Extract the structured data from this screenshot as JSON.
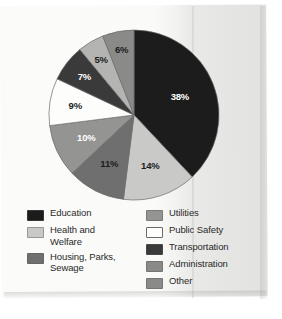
{
  "chart_data": {
    "type": "pie",
    "title": "",
    "subtitle": "",
    "xlabel": "",
    "ylabel": "",
    "grid": false,
    "legend_position": "bottom",
    "start_angle_deg": 0,
    "direction": "clockwise",
    "units": "percent",
    "total": 100,
    "categories": [
      "Education",
      "Health and Welfare",
      "Housing, Parks, Sewage",
      "Utilities",
      "Public Safety",
      "Transportation",
      "Administration",
      "Other"
    ],
    "values": [
      38,
      14,
      11,
      10,
      9,
      7,
      5,
      6
    ],
    "data_labels": [
      "38%",
      "14%",
      "11%",
      "10%",
      "9%",
      "7%",
      "5%",
      "6%"
    ],
    "colors": [
      "#1c1c1c",
      "#c9c9c7",
      "#6f6f6f",
      "#949492",
      "#fdfdfb",
      "#3a3a3a",
      "#b4b4b2",
      "#8a8a88"
    ],
    "label_text_colors": [
      "#ffffff",
      "#1c1c1c",
      "#1c1c1c",
      "#ffffff",
      "#1c1c1c",
      "#ffffff",
      "#1c1c1c",
      "#1c1c1c"
    ],
    "slices": [
      {
        "label": "Education",
        "value": 38,
        "data_label": "38%",
        "color": "#1c1c1c",
        "text_color": "#ffffff"
      },
      {
        "label": "Health and Welfare",
        "value": 14,
        "data_label": "14%",
        "color": "#c9c9c7",
        "text_color": "#1c1c1c"
      },
      {
        "label": "Housing, Parks, Sewage",
        "value": 11,
        "data_label": "11%",
        "color": "#6f6f6f",
        "text_color": "#1c1c1c"
      },
      {
        "label": "Utilities",
        "value": 10,
        "data_label": "10%",
        "color": "#949492",
        "text_color": "#ffffff"
      },
      {
        "label": "Public Safety",
        "value": 9,
        "data_label": "9%",
        "color": "#fdfdfb",
        "text_color": "#1c1c1c"
      },
      {
        "label": "Transportation",
        "value": 7,
        "data_label": "7%",
        "color": "#3a3a3a",
        "text_color": "#ffffff"
      },
      {
        "label": "Administration",
        "value": 5,
        "data_label": "5%",
        "color": "#b4b4b2",
        "text_color": "#1c1c1c"
      },
      {
        "label": "Other",
        "value": 6,
        "data_label": "6%",
        "color": "#8a8a88",
        "text_color": "#1c1c1c"
      }
    ]
  },
  "legend": {
    "columns": [
      {
        "items": [
          {
            "label": "Education",
            "color": "#1c1c1c",
            "outlined": false
          },
          {
            "label": "Health and\nWelfare",
            "color": "#c9c9c7",
            "outlined": false
          },
          {
            "label": "Housing, Parks,\nSewage",
            "color": "#6f6f6f",
            "outlined": false
          }
        ]
      },
      {
        "items": [
          {
            "label": "Utilities",
            "color": "#949492",
            "outlined": false
          },
          {
            "label": "Public Safety",
            "color": "#fdfdfb",
            "outlined": true
          },
          {
            "label": "Transportation",
            "color": "#3a3a3a",
            "outlined": false
          },
          {
            "label": "Administration",
            "color": "#8a8a88",
            "outlined": false
          },
          {
            "label": "Other",
            "color": "#8a8a88",
            "outlined": false
          }
        ]
      }
    ]
  },
  "page": {
    "background_color": "#fbfbf9",
    "shadow_color": "#e2e2e0"
  }
}
